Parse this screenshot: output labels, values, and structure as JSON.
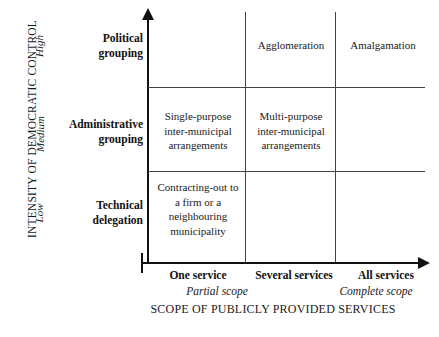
{
  "chart_data": {
    "type": "table",
    "title": "",
    "xlabel": "SCOPE OF PUBLICLY PROVIDED SERVICES",
    "ylabel": "INTENSITY OF DEMOCRATIC CONTROL",
    "x_categories": [
      "One service",
      "Several services",
      "All services"
    ],
    "x_subcategories": [
      "Partial scope",
      "Complete scope"
    ],
    "y_categories": [
      "High",
      "Medium",
      "Low"
    ],
    "row_labels": [
      "Political grouping",
      "Administrative grouping",
      "Technical delegation"
    ],
    "grid": true,
    "legend": "none",
    "cells": [
      [
        "",
        "Agglomeration",
        "Amalgamation"
      ],
      [
        "Single-purpose inter-municipal arrangements",
        "Multi-purpose inter-municipal arrangements",
        ""
      ],
      [
        "Contracting-out to a firm or a neighbouring municipality",
        "",
        ""
      ]
    ]
  },
  "axes": {
    "y_title": "INTENSITY OF DEMOCRATIC CONTROL",
    "y_ticks": {
      "high": "High",
      "medium": "Medium",
      "low": "Low"
    },
    "x_title": "SCOPE OF PUBLICLY PROVIDED SERVICES",
    "x_ticks": {
      "one": "One service",
      "several": "Several services",
      "all": "All services"
    },
    "x_scope": {
      "partial": "Partial scope",
      "complete": "Complete scope"
    }
  },
  "rows": {
    "political": {
      "line1": "Political",
      "line2": "grouping"
    },
    "administrative": {
      "line1": "Administrative",
      "line2": "grouping"
    },
    "technical": {
      "line1": "Technical",
      "line2": "delegation"
    }
  },
  "cells": {
    "agglomeration": "Agglomeration",
    "amalgamation": "Amalgamation",
    "single_purpose": {
      "line1": "Single-purpose",
      "line2": "inter-municipal",
      "line3": "arrangements"
    },
    "multi_purpose": {
      "line1": "Multi-purpose",
      "line2": "inter-municipal",
      "line3": "arrangements"
    },
    "contracting_out": {
      "line1": "Contracting-out to",
      "line2": "a firm or a",
      "line3": "neighbouring",
      "line4": "municipality"
    }
  },
  "colors": {
    "text": "#1a1a1a",
    "axis": "#111111",
    "grid": "#444444",
    "background": "#ffffff"
  }
}
